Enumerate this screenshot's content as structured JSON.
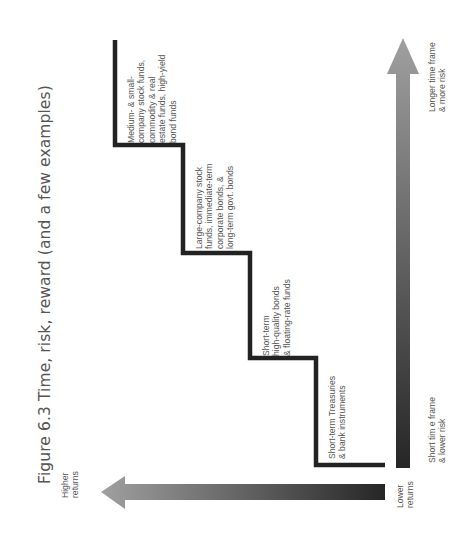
{
  "figure": {
    "title": "Figure 6.3 Time, risk, reward (and a few examples)",
    "orientation": "rotated -90deg"
  },
  "axes": {
    "returns_arrow": {
      "start_label": "Lower\nreturns",
      "end_label": "Higher\nreturns",
      "color_dark": "#2a2a2a",
      "color_light": "#9a9a9a"
    },
    "time_risk_arrow": {
      "start_label": "Short tim e frame\n& lower risk",
      "end_label": "Longer time frame\n& more risk",
      "color_dark": "#2a2a2a",
      "color_light": "#9a9a9a"
    }
  },
  "steps": [
    {
      "level": 1,
      "label": "Short-term Treasuries\n& bank instruments"
    },
    {
      "level": 2,
      "label": "Short-term\nhigh-quality bonds\n& floating-rate funds"
    },
    {
      "level": 3,
      "label": "Large-company stock\nfunds, immediate-term\ncorporate bonds, &\nlong-term govt. bonds"
    },
    {
      "level": 4,
      "label": "Medium- & small-\ncompany stock funds,\ncommodity & real\nestate funds, high-yield\nbond funds"
    }
  ],
  "colors": {
    "staircase": "#222222",
    "text": "#555555",
    "background": "#ffffff"
  }
}
